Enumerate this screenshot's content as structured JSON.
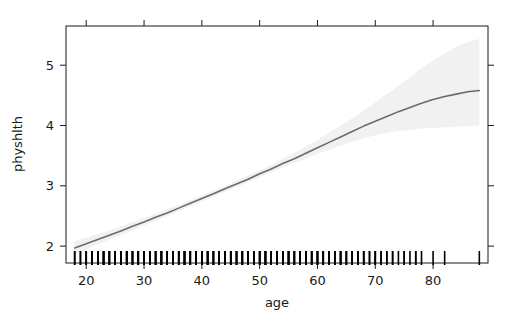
{
  "chart_data": {
    "type": "line",
    "title": "",
    "xlabel": "age",
    "ylabel": "physhlth",
    "xlim": [
      16.5,
      89.5
    ],
    "ylim": [
      1.72,
      5.65
    ],
    "xticks": [
      20,
      30,
      40,
      50,
      60,
      70,
      80
    ],
    "xtick_labels": [
      "20",
      "30",
      "40",
      "50",
      "60",
      "70",
      "80"
    ],
    "yticks": [
      2,
      3,
      4,
      5
    ],
    "ytick_labels": [
      "2",
      "3",
      "4",
      "5"
    ],
    "grid": false,
    "legend": null,
    "box": true,
    "ticks_all_sides": true,
    "series": [
      {
        "name": "fitted",
        "style": "line",
        "color": "#6b6b6b",
        "width": 1.6,
        "x": [
          18,
          20,
          22,
          24,
          26,
          28,
          30,
          32,
          34,
          36,
          38,
          40,
          42,
          44,
          46,
          48,
          50,
          52,
          54,
          56,
          58,
          60,
          62,
          64,
          66,
          68,
          70,
          72,
          74,
          76,
          78,
          80,
          82,
          84,
          86,
          88
        ],
        "y": [
          1.97,
          2.04,
          2.11,
          2.18,
          2.25,
          2.33,
          2.4,
          2.48,
          2.55,
          2.63,
          2.71,
          2.79,
          2.87,
          2.95,
          3.03,
          3.11,
          3.2,
          3.28,
          3.37,
          3.45,
          3.54,
          3.63,
          3.72,
          3.81,
          3.9,
          3.99,
          4.07,
          4.15,
          4.23,
          4.3,
          4.37,
          4.43,
          4.48,
          4.52,
          4.56,
          4.58
        ]
      },
      {
        "name": "confidence-band",
        "style": "band",
        "color": "#f1f1f1",
        "x": [
          18,
          20,
          22,
          24,
          26,
          28,
          30,
          32,
          34,
          36,
          38,
          40,
          42,
          44,
          46,
          48,
          50,
          52,
          54,
          56,
          58,
          60,
          62,
          64,
          66,
          68,
          70,
          72,
          74,
          76,
          78,
          80,
          82,
          84,
          86,
          88
        ],
        "lower": [
          1.87,
          1.95,
          2.03,
          2.11,
          2.18,
          2.26,
          2.34,
          2.42,
          2.5,
          2.58,
          2.66,
          2.74,
          2.82,
          2.9,
          2.98,
          3.06,
          3.14,
          3.22,
          3.3,
          3.38,
          3.45,
          3.53,
          3.6,
          3.67,
          3.73,
          3.79,
          3.84,
          3.88,
          3.91,
          3.93,
          3.95,
          3.96,
          3.97,
          3.98,
          3.99,
          4.0
        ],
        "upper": [
          2.08,
          2.14,
          2.2,
          2.26,
          2.33,
          2.4,
          2.47,
          2.54,
          2.61,
          2.68,
          2.76,
          2.84,
          2.92,
          3.0,
          3.08,
          3.17,
          3.26,
          3.35,
          3.45,
          3.55,
          3.65,
          3.76,
          3.88,
          4.0,
          4.12,
          4.25,
          4.38,
          4.52,
          4.66,
          4.8,
          4.95,
          5.08,
          5.2,
          5.3,
          5.38,
          5.44
        ]
      }
    ],
    "rug": {
      "name": "age-observations-rug",
      "axis": "x",
      "color": "#000000",
      "values": [
        18,
        18,
        19,
        19,
        20,
        20,
        20,
        21,
        21,
        21,
        21,
        22,
        22,
        22,
        22,
        22,
        23,
        23,
        23,
        23,
        23,
        24,
        24,
        24,
        24,
        25,
        25,
        25,
        25,
        25,
        26,
        26,
        26,
        26,
        27,
        27,
        27,
        27,
        27,
        28,
        28,
        28,
        28,
        29,
        29,
        29,
        29,
        29,
        30,
        30,
        30,
        30,
        31,
        31,
        31,
        31,
        31,
        32,
        32,
        32,
        32,
        33,
        33,
        33,
        33,
        33,
        34,
        34,
        34,
        34,
        35,
        35,
        35,
        35,
        35,
        36,
        36,
        36,
        36,
        37,
        37,
        37,
        37,
        37,
        38,
        38,
        38,
        38,
        39,
        39,
        39,
        39,
        39,
        40,
        40,
        40,
        40,
        41,
        41,
        41,
        41,
        41,
        42,
        42,
        42,
        42,
        43,
        43,
        43,
        43,
        43,
        44,
        44,
        44,
        44,
        45,
        45,
        45,
        45,
        45,
        46,
        46,
        46,
        46,
        47,
        47,
        47,
        47,
        47,
        48,
        48,
        48,
        48,
        49,
        49,
        49,
        49,
        49,
        50,
        50,
        50,
        50,
        51,
        51,
        51,
        51,
        51,
        52,
        52,
        52,
        52,
        53,
        53,
        53,
        53,
        53,
        54,
        54,
        54,
        54,
        55,
        55,
        55,
        55,
        55,
        56,
        56,
        56,
        56,
        57,
        57,
        57,
        57,
        57,
        58,
        58,
        58,
        58,
        59,
        59,
        59,
        59,
        60,
        60,
        60,
        60,
        61,
        61,
        61,
        61,
        62,
        62,
        62,
        62,
        63,
        63,
        63,
        64,
        64,
        64,
        64,
        65,
        65,
        65,
        66,
        66,
        66,
        67,
        67,
        67,
        68,
        68,
        68,
        69,
        69,
        70,
        70,
        70,
        71,
        71,
        72,
        72,
        73,
        73,
        74,
        75,
        75,
        76,
        77,
        77,
        78,
        80,
        82,
        88
      ]
    }
  },
  "axis": {
    "x_title": "age",
    "y_title": "physhlth"
  },
  "colors": {
    "curve": "#6b6b6b",
    "band": "#f1f1f1",
    "axis": "#1a1a1a",
    "rug": "#000000",
    "background": "#ffffff"
  }
}
